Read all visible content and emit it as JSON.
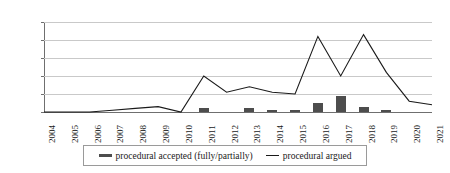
{
  "chart_data": {
    "type": "bar",
    "title": "",
    "subtitle": "",
    "xlabel": "",
    "ylabel": "",
    "categories": [
      "2004",
      "2005",
      "2006",
      "2007",
      "2008",
      "2009",
      "2010",
      "2011",
      "2012",
      "2013",
      "2014",
      "2015",
      "2016",
      "2017",
      "2018",
      "2019",
      "2020",
      "2021"
    ],
    "ylim": [
      0,
      50
    ],
    "yticks": [
      0,
      10,
      20,
      30,
      40,
      50
    ],
    "ytick_labels": [
      "0",
      "10",
      "20",
      "30",
      "40",
      "50"
    ],
    "grid": true,
    "legend_position": "bottom",
    "series": [
      {
        "name": "procedural accepted (fully/partially)",
        "type": "bar",
        "color": "#4d4d4d",
        "values": [
          0,
          0,
          0,
          0,
          0,
          0,
          0,
          2,
          0,
          2,
          1,
          1,
          5,
          9,
          3,
          1,
          0,
          0
        ]
      },
      {
        "name": "procedural argued",
        "type": "line",
        "color": "#1a1a1a",
        "values": [
          0,
          0,
          0,
          1,
          2,
          3,
          0,
          20,
          11,
          14,
          11,
          10,
          42,
          20,
          43,
          22,
          6,
          4
        ]
      }
    ]
  },
  "legend": {
    "items": [
      {
        "label": "procedural accepted (fully/partially)",
        "marker": "bar-swatch"
      },
      {
        "label": "procedural argued",
        "marker": "line-swatch"
      }
    ]
  },
  "colors": {
    "bar": "#4d4d4d",
    "line": "#1a1a1a",
    "grid": "#c9c9c9",
    "axis": "#6f6f6f",
    "background": "#ffffff"
  }
}
